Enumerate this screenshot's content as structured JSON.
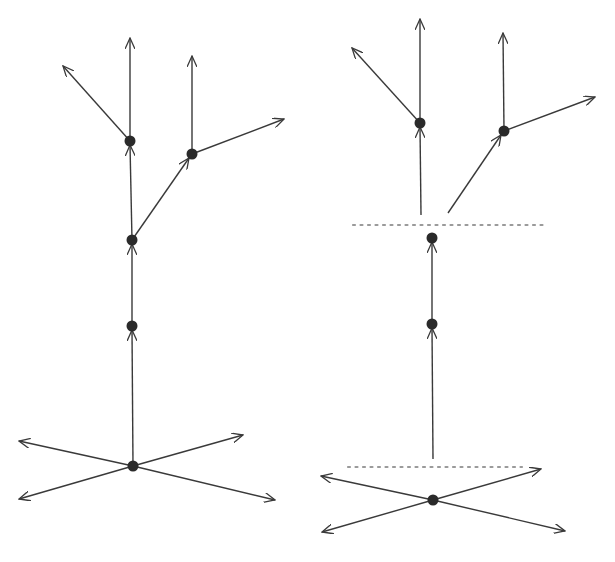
{
  "figure": {
    "colors": {
      "lines": "#3a3a3a",
      "nodes": "#2a2a2a",
      "cut_lines": "#9a9a9a",
      "background": "#ffffff"
    }
  },
  "diagrams": [
    {
      "name": "left-tree",
      "nodes": [
        [
          133,
          466
        ],
        [
          132,
          326
        ],
        [
          132,
          240
        ],
        [
          130,
          141
        ],
        [
          192,
          154
        ]
      ],
      "edges": [
        {
          "from": [
            133,
            466
          ],
          "to": [
            132,
            330
          ],
          "mid_arrow": true
        },
        {
          "from": [
            132,
            326
          ],
          "to": [
            132,
            244
          ],
          "mid_arrow": true
        },
        {
          "from": [
            132,
            240
          ],
          "to": [
            130,
            145
          ],
          "mid_arrow": true
        },
        {
          "from": [
            132,
            240
          ],
          "to": [
            189,
            158
          ],
          "mid_arrow": true
        },
        {
          "from": [
            130,
            141
          ],
          "to": [
            130,
            38
          ],
          "arrow": true
        },
        {
          "from": [
            130,
            141
          ],
          "to": [
            63,
            66
          ],
          "arrow": true
        },
        {
          "from": [
            192,
            154
          ],
          "to": [
            192,
            56
          ],
          "arrow": true
        },
        {
          "from": [
            192,
            154
          ],
          "to": [
            284,
            119
          ],
          "arrow": true
        },
        {
          "from": [
            133,
            466
          ],
          "to": [
            19,
            441
          ],
          "arrow": true
        },
        {
          "from": [
            133,
            466
          ],
          "to": [
            243,
            435
          ],
          "arrow": true
        },
        {
          "from": [
            133,
            466
          ],
          "to": [
            19,
            499
          ],
          "arrow": true
        },
        {
          "from": [
            133,
            466
          ],
          "to": [
            275,
            500
          ],
          "arrow": true
        }
      ],
      "cuts": []
    },
    {
      "name": "right-tree-factorized",
      "nodes": [
        [
          433,
          500
        ],
        [
          432,
          324
        ],
        [
          432,
          238
        ],
        [
          420,
          123
        ],
        [
          504,
          131
        ]
      ],
      "edges": [
        {
          "from": [
            433,
            459
          ],
          "to": [
            432,
            328
          ],
          "mid_arrow": true
        },
        {
          "from": [
            432,
            324
          ],
          "to": [
            432,
            242
          ],
          "mid_arrow": true
        },
        {
          "from": [
            421,
            215
          ],
          "to": [
            420,
            127
          ],
          "mid_arrow": true
        },
        {
          "from": [
            448,
            213
          ],
          "to": [
            501,
            135
          ],
          "mid_arrow": true
        },
        {
          "from": [
            420,
            123
          ],
          "to": [
            420,
            19
          ],
          "arrow": true
        },
        {
          "from": [
            420,
            123
          ],
          "to": [
            352,
            48
          ],
          "arrow": true
        },
        {
          "from": [
            504,
            131
          ],
          "to": [
            503,
            33
          ],
          "arrow": true
        },
        {
          "from": [
            504,
            131
          ],
          "to": [
            595,
            97
          ],
          "arrow": true
        },
        {
          "from": [
            433,
            500
          ],
          "to": [
            321,
            476
          ],
          "arrow": true
        },
        {
          "from": [
            433,
            500
          ],
          "to": [
            541,
            469
          ],
          "arrow": true
        },
        {
          "from": [
            433,
            500
          ],
          "to": [
            322,
            532
          ],
          "arrow": true
        },
        {
          "from": [
            433,
            500
          ],
          "to": [
            565,
            531
          ],
          "arrow": true
        }
      ],
      "cuts": [
        {
          "x1": 353,
          "x2": 545,
          "y": 225
        },
        {
          "x1": 348,
          "x2": 522,
          "y": 467
        }
      ]
    }
  ]
}
